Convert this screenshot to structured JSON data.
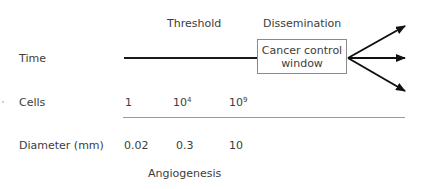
{
  "diagram": {
    "header_labels": {
      "threshold": "Threshold",
      "dissemination": "Dissemination"
    },
    "rows": {
      "time": {
        "label": "Time"
      },
      "cells": {
        "label": "Cells",
        "values": [
          {
            "base": "1",
            "exp": ""
          },
          {
            "base": "10",
            "exp": "4"
          },
          {
            "base": "10",
            "exp": "9"
          }
        ]
      },
      "diameter": {
        "label": "Diameter (mm)",
        "values": [
          "0.02",
          "0.3",
          "10"
        ]
      }
    },
    "box": {
      "line1": "Cancer control",
      "line2": "window"
    },
    "footer_label": "Angiogenesis",
    "arrows": {
      "count": 3,
      "directions": [
        "up-right",
        "right",
        "down-right"
      ]
    },
    "colors": {
      "text": "#3c3c3c",
      "timeline": "#1a1a1a",
      "rule": "#9a9a9a",
      "box_border": "#8a8a8a"
    }
  }
}
